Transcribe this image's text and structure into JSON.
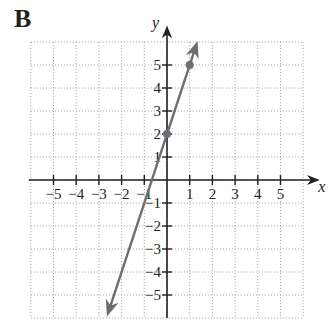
{
  "panel_label": "B",
  "chart_data": {
    "type": "line",
    "title": "",
    "xlabel": "x",
    "ylabel": "y",
    "xlim": [
      -6,
      6
    ],
    "ylim": [
      -6,
      6
    ],
    "grid": true,
    "x_ticks": [
      -5,
      -4,
      -3,
      -2,
      -1,
      1,
      2,
      3,
      4,
      5
    ],
    "y_ticks": [
      -5,
      -4,
      -3,
      -2,
      -1,
      1,
      2,
      3,
      4,
      5
    ],
    "x_tick_labels": [
      "−5",
      "−4",
      "−3",
      "−2",
      "−1",
      "1",
      "2",
      "3",
      "4",
      "5"
    ],
    "y_tick_labels": [
      "−5",
      "−4",
      "−3",
      "−2",
      "−1",
      "1",
      "2",
      "3",
      "4",
      "5"
    ],
    "series": [
      {
        "name": "y = 3x + 2",
        "slope": 3,
        "intercept": 2,
        "line_endpoints": [
          [
            -2.6,
            -5.8
          ],
          [
            1.3,
            5.9
          ]
        ],
        "marked_points": [
          [
            0,
            2
          ],
          [
            1,
            5
          ]
        ],
        "color": "#6d6e71"
      }
    ]
  },
  "colors": {
    "axis": "#231f20",
    "grid": "#9a9a9a",
    "line": "#6d6e71",
    "point": "#6d6e71"
  }
}
